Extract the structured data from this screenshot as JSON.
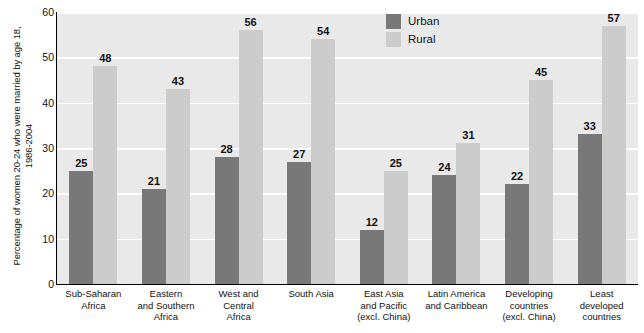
{
  "chart_data": {
    "type": "bar",
    "title": "",
    "xlabel": "",
    "ylabel": "Percentage of women 20-24 who were married by age 18, 1986-2004",
    "ylabel_lines": [
      "Percentage of women 20-24 who were married by age 18,",
      "1986-2004"
    ],
    "ylim": [
      0,
      60
    ],
    "ytick_step": 10,
    "yticks": [
      0,
      10,
      20,
      30,
      40,
      50,
      60
    ],
    "ytick_labels": [
      "0",
      "10",
      "20",
      "30",
      "40",
      "50",
      "60"
    ],
    "grid": true,
    "grid_color": "#ffffff",
    "plot_background": "#e9e9e9",
    "legend_position": "top-center-right",
    "categories": [
      "Sub-Saharan Africa",
      "Eastern and Southern Africa",
      "West and Central Africa",
      "South Asia",
      "East Asia and Pacific (excl. China)",
      "Latin America and Caribbean",
      "Developing countries (excl. China)",
      "Least developed countries"
    ],
    "category_lines": [
      [
        "Sub-Saharan",
        "Africa"
      ],
      [
        "Eastern",
        "and Southern",
        "Africa"
      ],
      [
        "West and",
        "Central",
        "Africa"
      ],
      [
        "South Asia"
      ],
      [
        "East Asia",
        "and Pacific",
        "(excl. China)"
      ],
      [
        "Latin America",
        "and Caribbean"
      ],
      [
        "Developing",
        "countries",
        "(excl. China)"
      ],
      [
        "Least",
        "developed",
        "countries"
      ]
    ],
    "series": [
      {
        "name": "Urban",
        "color": "#787878",
        "values": [
          25,
          21,
          28,
          27,
          12,
          24,
          22,
          33
        ]
      },
      {
        "name": "Rural",
        "color": "#cccccc",
        "values": [
          48,
          43,
          56,
          54,
          25,
          31,
          45,
          57
        ]
      }
    ]
  },
  "legend": {
    "items": [
      {
        "label": "Urban",
        "swatch": "urban"
      },
      {
        "label": "Rural",
        "swatch": "rural"
      }
    ]
  }
}
